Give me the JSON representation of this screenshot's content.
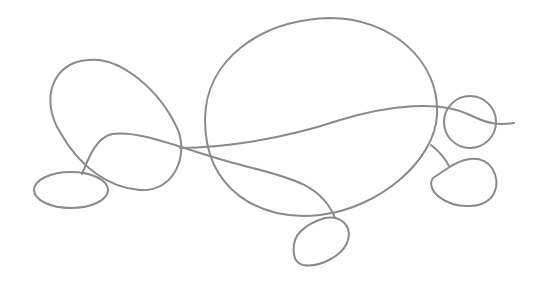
{
  "drawing": {
    "stroke_color": "#8a8a8a",
    "background": "#ffffff",
    "shapes": [
      {
        "name": "left-large-loop"
      },
      {
        "name": "left-foot-oval"
      },
      {
        "name": "central-body-oval"
      },
      {
        "name": "head-circle"
      },
      {
        "name": "right-foot-blob"
      },
      {
        "name": "bottom-foot-oval"
      },
      {
        "name": "long-wavy-line"
      }
    ]
  }
}
